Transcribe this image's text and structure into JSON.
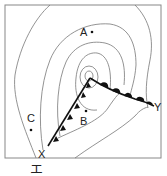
{
  "diagram": {
    "type": "weather-map",
    "points": [
      {
        "label": "A",
        "x": 92,
        "y": 32
      },
      {
        "label": "B",
        "x": 86,
        "y": 111
      },
      {
        "label": "C",
        "x": 31,
        "y": 130
      }
    ],
    "front_endpoints": {
      "cold_front_end": "X",
      "warm_front_end": "Y"
    },
    "caption": "エ"
  },
  "colors": {
    "isobar": "#777777",
    "front": "#111111",
    "frame": "#888888"
  }
}
